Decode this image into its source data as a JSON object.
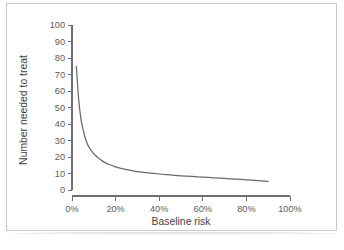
{
  "figure": {
    "frame_color": "#c9c9cb",
    "background": "#ffffff"
  },
  "chart_data": {
    "type": "line",
    "title": "",
    "subtitle": "",
    "xlabel": "Baseline risk",
    "ylabel": "Number needed to treat",
    "xlim": [
      0,
      100
    ],
    "ylim": [
      0,
      100
    ],
    "grid": false,
    "legend": false,
    "legend_position": "none",
    "line_color": "#6a6a6e",
    "xtick_labels": [
      "0%",
      "20%",
      "40%",
      "60%",
      "80%",
      "100%"
    ],
    "xtick_values": [
      0,
      20,
      40,
      60,
      80,
      100
    ],
    "ytick_labels": [
      "0",
      "10",
      "20",
      "30",
      "40",
      "50",
      "60",
      "70",
      "80",
      "90",
      "100"
    ],
    "ytick_values": [
      0,
      10,
      20,
      30,
      40,
      50,
      60,
      70,
      80,
      90,
      100
    ],
    "series": [
      {
        "name": "Number needed to treat",
        "x": [
          2,
          3,
          4,
          5,
          6,
          7,
          8,
          9,
          10,
          12,
          14,
          16,
          18,
          20,
          24,
          28,
          32,
          36,
          40,
          45,
          50,
          55,
          60,
          65,
          70,
          75,
          80,
          85,
          90
        ],
        "y": [
          75,
          56,
          44,
          37,
          32,
          28,
          25.5,
          23.5,
          22,
          19.5,
          17.5,
          16,
          15,
          14,
          12.6,
          11.6,
          10.8,
          10.2,
          9.7,
          9.1,
          8.6,
          8.2,
          7.8,
          7.4,
          7.0,
          6.6,
          6.2,
          5.7,
          5.2
        ]
      }
    ],
    "annotations": []
  },
  "axis": {
    "x_title": "Baseline risk",
    "y_title": "Number needed to treat"
  }
}
